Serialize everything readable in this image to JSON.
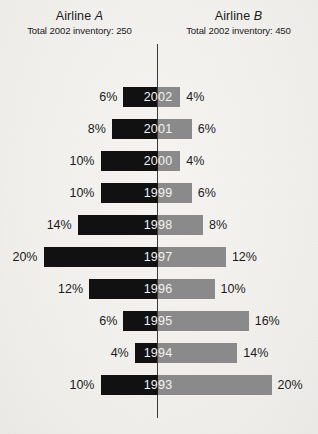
{
  "header": {
    "left": {
      "title_prefix": "Airline ",
      "title_letter": "A",
      "subtitle": "Total 2002 inventory: 250"
    },
    "right": {
      "title_prefix": "Airline ",
      "title_letter": "B",
      "subtitle": "Total 2002 inventory: 450"
    }
  },
  "colors": {
    "background": "#f4f3f1",
    "left_bar": "#111111",
    "right_bar": "#8a8a8a",
    "axis": "#3a3a3a",
    "text": "#1b1b1b",
    "year_label": "#f2f2f2"
  },
  "chart_data": {
    "type": "bar",
    "subtype": "diverging-butterfly",
    "title": "",
    "xlabel": "",
    "ylabel": "",
    "categories": [
      "2002",
      "2001",
      "2000",
      "1999",
      "1998",
      "1997",
      "1996",
      "1995",
      "1994",
      "1993"
    ],
    "series": [
      {
        "name": "Airline A",
        "side": "left",
        "color": "#111111",
        "unit": "%",
        "values": [
          6,
          8,
          10,
          10,
          14,
          20,
          12,
          6,
          4,
          10
        ],
        "labels": [
          "6%",
          "8%",
          "10%",
          "10%",
          "14%",
          "20%",
          "12%",
          "6%",
          "4%",
          "10%"
        ]
      },
      {
        "name": "Airline B",
        "side": "right",
        "color": "#8a8a8a",
        "unit": "%",
        "values": [
          4,
          6,
          4,
          6,
          8,
          12,
          10,
          16,
          14,
          20
        ],
        "labels": [
          "4%",
          "6%",
          "4%",
          "6%",
          "8%",
          "12%",
          "10%",
          "16%",
          "14%",
          "20%"
        ]
      }
    ],
    "xlim": [
      0,
      20
    ],
    "grid": false,
    "legend": "none",
    "axis_center": true,
    "px_per_percent": 5.7
  }
}
